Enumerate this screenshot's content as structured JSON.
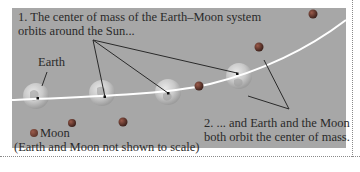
{
  "figure": {
    "caption_1": {
      "line1": "1. The center of mass of the Earth–Moon system",
      "line2": "orbits around the Sun..."
    },
    "caption_2": {
      "line1": "2. ... and Earth and the Moon",
      "line2": "both orbit the center of mass."
    },
    "labels": {
      "earth": "Earth",
      "moon": "Moon",
      "scale_note": "(Earth and Moon not shown to scale)"
    },
    "colors": {
      "panel_background": "#a7a7a7",
      "orbit_path": "#ffffff",
      "pointer_lines": "#2a2a2a",
      "moon": "#6a3a30",
      "earth": "#d8d8d8",
      "text": "#2a2a2a"
    },
    "elements": {
      "earth_positions": [
        [
          36,
          97
        ],
        [
          102,
          94
        ],
        [
          168,
          92
        ],
        [
          238,
          74
        ]
      ],
      "moon_positions": [
        [
          72,
          164
        ],
        [
          156,
          75
        ],
        [
          232,
          47
        ],
        [
          288,
          13
        ]
      ],
      "center_of_mass_dots": [
        [
          38,
          98
        ],
        [
          104,
          96
        ],
        [
          168,
          93
        ],
        [
          236,
          73
        ]
      ],
      "caption1_pointer_origin": [
        93,
        40
      ],
      "caption2_pointer_origin": [
        289,
        109
      ]
    }
  }
}
